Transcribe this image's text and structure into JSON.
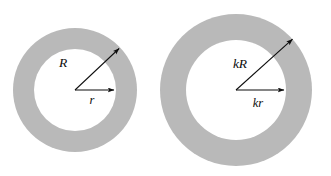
{
  "figure": {
    "type": "geometric-diagram",
    "background_color": "#ffffff",
    "annulus_fill_color": "#b9b9b9",
    "inner_disk_color": "#ffffff",
    "stroke_color": "#0d0d0d",
    "shapes": [
      {
        "name": "left-annulus",
        "center_x": 75,
        "center_y": 90,
        "outer_radius": 62,
        "inner_radius": 41,
        "arrows": [
          {
            "name": "outer-radius-arrow",
            "label": "R",
            "angle_deg": 42,
            "length": 62,
            "label_x": 63,
            "label_y": 67
          },
          {
            "name": "inner-radius-arrow",
            "label": "r",
            "angle_deg": 0,
            "length": 41,
            "label_x": 59,
            "label_y": 104
          }
        ]
      },
      {
        "name": "right-annulus",
        "center_x": 236,
        "center_y": 90,
        "outer_radius": 76,
        "inner_radius": 50,
        "arrows": [
          {
            "name": "outer-radius-arrow",
            "label": "kR",
            "angle_deg": 42,
            "length": 76,
            "label_x": 228,
            "label_y": 68
          },
          {
            "name": "inner-radius-arrow",
            "label": "kr",
            "angle_deg": 0,
            "length": 50,
            "label_x": 253,
            "label_y": 107
          }
        ]
      }
    ],
    "labels": {
      "left_outer": "R",
      "left_inner": "r",
      "right_outer": "kR",
      "right_inner": "kr"
    }
  }
}
